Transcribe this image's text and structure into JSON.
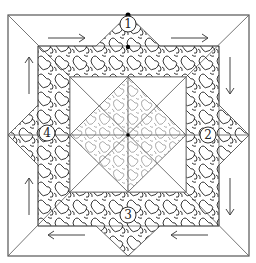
{
  "diagram": {
    "colors": {
      "line": "#555555",
      "stipple": "#222222",
      "stipple_light": "#777777",
      "background": "#ffffff",
      "dot": "#000000"
    },
    "markers": [
      {
        "label": "1",
        "position": "top"
      },
      {
        "label": "2",
        "position": "right"
      },
      {
        "label": "3",
        "position": "bottom"
      },
      {
        "label": "4",
        "position": "left"
      }
    ],
    "arrows": [
      {
        "side": "top",
        "direction": "right"
      },
      {
        "side": "right",
        "direction": "down"
      },
      {
        "side": "bottom",
        "direction": "left"
      },
      {
        "side": "left",
        "direction": "up"
      }
    ],
    "regions": {
      "outer_border": "plain",
      "star_band": "dense stipple",
      "center_diamond": "light stipple",
      "inner_corners": "plain"
    }
  }
}
